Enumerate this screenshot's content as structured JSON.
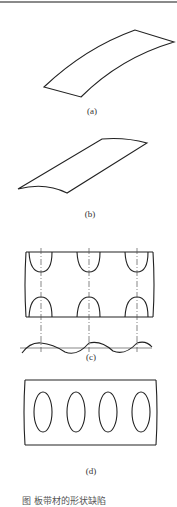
{
  "figure": {
    "colors": {
      "stroke": "#222222",
      "centerline": "#555555",
      "topline": "#8a8a8a"
    },
    "panels": [
      {
        "id": "a",
        "label": "(a)",
        "description": "longitudinal bow (curved strip)"
      },
      {
        "id": "b",
        "label": "(b)",
        "description": "twisted / skewed strip"
      },
      {
        "id": "c",
        "label": "(c)",
        "description": "edge wave with wave profile"
      },
      {
        "id": "d",
        "label": "(d)",
        "description": "center buckles (oval bulges)"
      }
    ],
    "caption": "图      板带材的形状缺陷"
  }
}
